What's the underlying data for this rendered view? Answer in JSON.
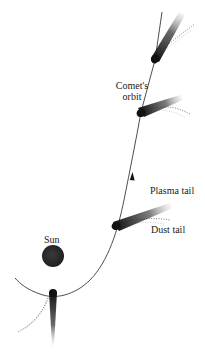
{
  "diagram": {
    "labels": {
      "orbit_line1": "Comet's",
      "orbit_line2": "orbit",
      "plasma_tail": "Plasma tail",
      "dust_tail": "Dust tail",
      "sun": "Sun"
    },
    "colors": {
      "background": "#ffffff",
      "orbit": "#333333",
      "sun": "#2a2a2a",
      "comet_head": "#1a1a1a",
      "text": "#1a1a1a"
    },
    "elements": {
      "sun": {
        "cx": 53,
        "cy": 256,
        "r": 11
      },
      "comets": [
        {
          "position": "top",
          "head": [
            155,
            60
          ],
          "plasma_tail_end": [
            182,
            14
          ],
          "dust_tail_end": [
            192,
            24
          ]
        },
        {
          "position": "upper-middle",
          "head": [
            141,
            112
          ],
          "plasma_tail_end": [
            183,
            98
          ],
          "dust_tail_end": [
            190,
            117
          ]
        },
        {
          "position": "lower-middle",
          "head": [
            116,
            226
          ],
          "plasma_tail_end": [
            172,
            206
          ],
          "dust_tail_end": [
            168,
            222
          ]
        },
        {
          "position": "perihelion",
          "head": [
            53,
            293
          ],
          "plasma_tail_end": [
            53,
            346
          ],
          "dust_tail_end": [
            18,
            332
          ]
        }
      ],
      "direction_arrow": {
        "x": 132,
        "y": 178,
        "direction": "up"
      }
    }
  }
}
